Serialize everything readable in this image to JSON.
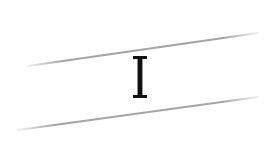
{
  "captcha": {
    "character": "I",
    "character_color": "#111111",
    "line_color": "#9a9a9a",
    "background": "#ffffff",
    "lines": [
      {
        "x1": 28,
        "y1": 66,
        "x2": 258,
        "y2": 33
      },
      {
        "x1": 18,
        "y1": 130,
        "x2": 258,
        "y2": 97
      }
    ]
  }
}
